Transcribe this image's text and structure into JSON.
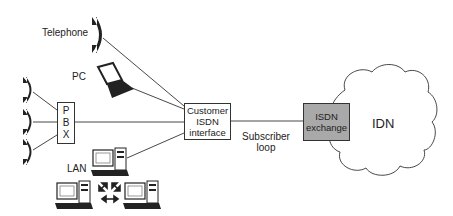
{
  "diagram": {
    "nodes": {
      "telephone": {
        "label": "Telephone"
      },
      "pc": {
        "label": "PC"
      },
      "pbx": {
        "label_lines": [
          "P",
          "B",
          "X"
        ]
      },
      "lan": {
        "label": "LAN"
      },
      "customer_interface": {
        "label_lines": [
          "Customer",
          "ISDN",
          "interface"
        ]
      },
      "isdn_exchange": {
        "label_lines": [
          "ISDN",
          "exchange"
        ],
        "fill": "#a9a9a9"
      },
      "idn": {
        "label": "IDN"
      }
    },
    "edges": {
      "subscriber_loop": {
        "label_lines": [
          "Subscriber",
          "loop"
        ]
      }
    },
    "colors": {
      "line": "#333333",
      "device": "#222222",
      "background": "#ffffff"
    }
  }
}
